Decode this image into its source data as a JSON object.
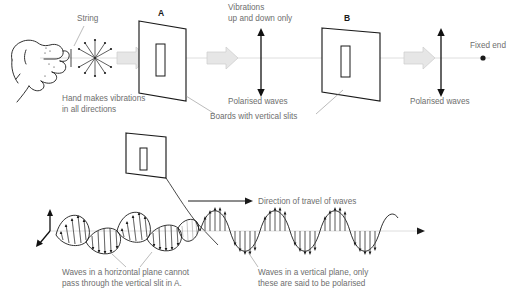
{
  "figure": {
    "background_color": "#ffffff",
    "label_color": "#6e6e6e",
    "ink_color": "#1a1a1a",
    "block_arrow_color": "#e6e6e6",
    "axis_color": "#d6d6d6"
  },
  "top_scene": {
    "string_label": "String",
    "hand_caption_line1": "Hand makes vibrations",
    "hand_caption_line2": "in all directions",
    "board_a_label": "A",
    "board_b_label": "B",
    "vibrations_line1": "Vibrations",
    "vibrations_line2": "up and down only",
    "polarised_waves_1": "Polarised waves",
    "polarised_waves_2": "Polarised waves",
    "boards_caption": "Boards with vertical slits",
    "fixed_end_label": "Fixed end"
  },
  "bottom_scene": {
    "direction_label": "Direction of travel of waves",
    "horizontal_caption_line1": "Waves in a horizontal plane cannot",
    "horizontal_caption_line2": "pass through the vertical slit in A.",
    "vertical_caption_line1": "Waves in a vertical plane, only",
    "vertical_caption_line2": "these are said to be polarised"
  },
  "icons": {
    "hand": "hand-icon",
    "starburst": "starburst-vibration-icon",
    "block_arrow": "block-arrow-icon",
    "double_arrow": "double-headed-arrow-icon",
    "fixed_end_dot": "fixed-end-dot-icon",
    "board": "slit-board-icon",
    "wave": "sine-wave-icon",
    "axis_3d": "three-d-axis-icon"
  }
}
